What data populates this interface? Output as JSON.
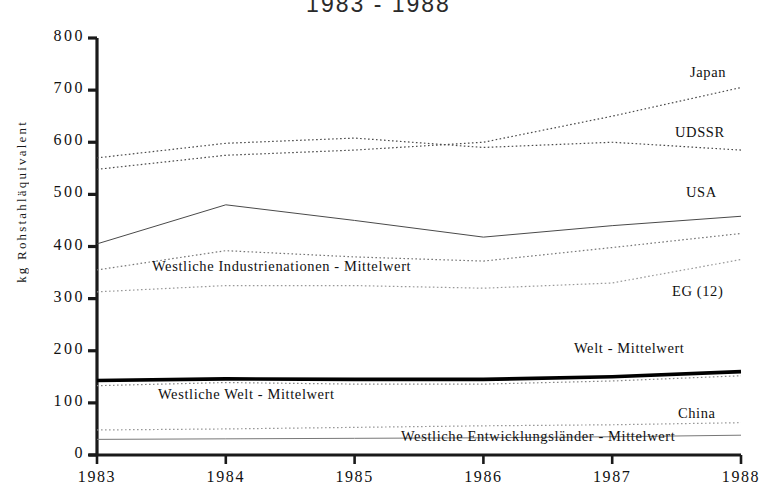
{
  "chart_data": {
    "type": "line",
    "title": "1983 - 1988",
    "xlabel": "",
    "ylabel": "kg Rohstahläquivalent",
    "x": [
      1983,
      1984,
      1985,
      1986,
      1987,
      1988
    ],
    "xtick_labels": [
      "1983",
      "1984",
      "1985",
      "1986",
      "1987",
      "1988"
    ],
    "ytick_labels": [
      "0",
      "100",
      "200",
      "300",
      "400",
      "500",
      "600",
      "700",
      "800"
    ],
    "yticks": [
      0,
      100,
      200,
      300,
      400,
      500,
      600,
      700,
      800
    ],
    "ylim": [
      0,
      800
    ],
    "xlim": [
      1983,
      1988
    ],
    "grid": false,
    "legend_position": "inline-right",
    "series": [
      {
        "name": "Japan",
        "label": "Japan",
        "style": "dotted",
        "color": "#4a4a4a",
        "values": [
          548,
          575,
          585,
          600,
          650,
          705
        ],
        "label_x": 690,
        "label_y": 64
      },
      {
        "name": "UDSSR",
        "label": "UDSSR",
        "style": "dotted",
        "color": "#4a4a4a",
        "values": [
          570,
          598,
          608,
          590,
          600,
          585
        ],
        "label_x": 675,
        "label_y": 124
      },
      {
        "name": "USA",
        "label": "USA",
        "style": "solid",
        "color": "#4a4a4a",
        "values": [
          405,
          480,
          450,
          418,
          440,
          458
        ],
        "label_x": 686,
        "label_y": 184
      },
      {
        "name": "Westliche Industrienationen - Mittelwert",
        "label": "Westliche Industrienationen - Mittelwert",
        "style": "dotted",
        "color": "#777777",
        "values": [
          355,
          392,
          380,
          372,
          398,
          425
        ],
        "label_x": 152,
        "label_y": 258
      },
      {
        "name": "EG (12)",
        "label": "EG (12)",
        "style": "dotted",
        "color": "#999999",
        "values": [
          313,
          325,
          325,
          320,
          330,
          375
        ],
        "label_x": 672,
        "label_y": 283
      },
      {
        "name": "Welt - Mittelwert",
        "label": "Welt - Mittelwert",
        "style": "bold",
        "color": "#000000",
        "values": [
          143,
          146,
          145,
          145,
          150,
          160
        ],
        "label_x": 574,
        "label_y": 340
      },
      {
        "name": "Westliche Welt - Mittelwert",
        "label": "Westliche Welt - Mittelwert",
        "style": "dotted",
        "color": "#888888",
        "values": [
          133,
          139,
          136,
          136,
          142,
          152
        ],
        "label_x": 158,
        "label_y": 386
      },
      {
        "name": "China",
        "label": "China",
        "style": "dotted",
        "color": "#999999",
        "values": [
          48,
          50,
          53,
          56,
          58,
          62
        ],
        "label_x": 678,
        "label_y": 405
      },
      {
        "name": "Westliche Entwicklungsländer - Mittelwert",
        "label": "Westliche Entwicklungsländer - Mittelwert",
        "style": "solid",
        "color": "#777777",
        "values": [
          30,
          31,
          32,
          33,
          35,
          38
        ],
        "label_x": 401,
        "label_y": 428
      }
    ]
  }
}
